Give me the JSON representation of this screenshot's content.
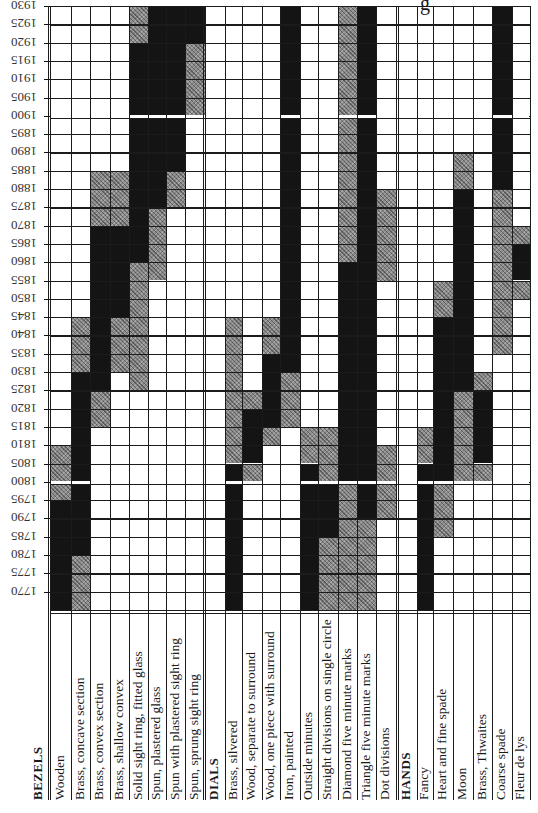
{
  "chart_data": {
    "type": "heatmap",
    "title": "",
    "title_fragment_visible": "g",
    "orientation_note": "Year axis labels printed rotated 180 degrees; category labels rotated 90 degrees (read bottom-to-top)",
    "ylabel": "Year",
    "y_ticks": [
      1930,
      1925,
      1920,
      1915,
      1910,
      1905,
      1900,
      1895,
      1890,
      1885,
      1880,
      1875,
      1870,
      1865,
      1860,
      1855,
      1850,
      1845,
      1840,
      1835,
      1830,
      1825,
      1820,
      1815,
      1810,
      1805,
      1800,
      1795,
      1790,
      1785,
      1780,
      1775,
      1770
    ],
    "row_interval_years": 5,
    "legend": {
      "B": "solid black (in common use)",
      "H": "hatched grey (occasional / transitional use)"
    },
    "groups": [
      {
        "name": "BEZELS",
        "items": [
          {
            "label": "Wooden",
            "spans": [
              {
                "t": "H",
                "from": 1810,
                "to": 1795
              },
              {
                "t": "B",
                "from": 1795,
                "to": 1765
              }
            ]
          },
          {
            "label": "Brass, concave section",
            "spans": [
              {
                "t": "H",
                "from": 1845,
                "to": 1830
              },
              {
                "t": "B",
                "from": 1830,
                "to": 1780
              },
              {
                "t": "H",
                "from": 1780,
                "to": 1765
              }
            ]
          },
          {
            "label": "Brass, convex section",
            "spans": [
              {
                "t": "H",
                "from": 1885,
                "to": 1870
              },
              {
                "t": "B",
                "from": 1870,
                "to": 1825
              },
              {
                "t": "H",
                "from": 1825,
                "to": 1815
              }
            ]
          },
          {
            "label": "Brass, shallow convex",
            "spans": [
              {
                "t": "H",
                "from": 1885,
                "to": 1870
              },
              {
                "t": "B",
                "from": 1870,
                "to": 1845
              },
              {
                "t": "H",
                "from": 1845,
                "to": 1830
              }
            ]
          },
          {
            "label": "Solid sight ring, fitted glass",
            "spans": [
              {
                "t": "H",
                "from": 1930,
                "to": 1920
              },
              {
                "t": "B",
                "from": 1920,
                "to": 1860
              },
              {
                "t": "H",
                "from": 1860,
                "to": 1825
              }
            ]
          },
          {
            "label": "Spun, plastered glass",
            "spans": [
              {
                "t": "B",
                "from": 1930,
                "to": 1875
              },
              {
                "t": "H",
                "from": 1875,
                "to": 1855
              }
            ]
          },
          {
            "label": "Spun with plastered sight ring",
            "spans": [
              {
                "t": "B",
                "from": 1930,
                "to": 1885
              },
              {
                "t": "H",
                "from": 1885,
                "to": 1875
              }
            ]
          },
          {
            "label": "Spun, sprung sight ring",
            "spans": [
              {
                "t": "B",
                "from": 1930,
                "to": 1920
              },
              {
                "t": "H",
                "from": 1920,
                "to": 1900
              }
            ]
          }
        ]
      },
      {
        "name": "DIALS",
        "items": [
          {
            "label": "Brass, silvered",
            "spans": [
              {
                "t": "H",
                "from": 1845,
                "to": 1805
              },
              {
                "t": "B",
                "from": 1805,
                "to": 1765
              }
            ]
          },
          {
            "label": "Wood, separate to surround",
            "spans": [
              {
                "t": "H",
                "from": 1825,
                "to": 1820
              },
              {
                "t": "B",
                "from": 1820,
                "to": 1805
              },
              {
                "t": "H",
                "from": 1805,
                "to": 1800
              }
            ]
          },
          {
            "label": "Wood, one piece with surround",
            "spans": [
              {
                "t": "H",
                "from": 1845,
                "to": 1835
              },
              {
                "t": "B",
                "from": 1835,
                "to": 1815
              },
              {
                "t": "H",
                "from": 1815,
                "to": 1810
              }
            ]
          },
          {
            "label": "Iron, painted",
            "spans": [
              {
                "t": "B",
                "from": 1930,
                "to": 1830
              },
              {
                "t": "H",
                "from": 1830,
                "to": 1815
              }
            ]
          },
          {
            "label": "Outside minutes",
            "spans": [
              {
                "t": "H",
                "from": 1815,
                "to": 1805
              },
              {
                "t": "B",
                "from": 1805,
                "to": 1765
              }
            ]
          },
          {
            "label": "Straight divisions on single circle",
            "spans": [
              {
                "t": "H",
                "from": 1815,
                "to": 1800
              },
              {
                "t": "B",
                "from": 1800,
                "to": 1785
              },
              {
                "t": "H",
                "from": 1785,
                "to": 1765
              }
            ]
          },
          {
            "label": "Diamond five minute marks",
            "spans": [
              {
                "t": "H",
                "from": 1930,
                "to": 1860
              },
              {
                "t": "B",
                "from": 1860,
                "to": 1800
              },
              {
                "t": "H",
                "from": 1800,
                "to": 1765
              }
            ]
          },
          {
            "label": "Triangle five minute marks",
            "spans": [
              {
                "t": "B",
                "from": 1930,
                "to": 1790
              },
              {
                "t": "H",
                "from": 1790,
                "to": 1765
              }
            ]
          },
          {
            "label": "Dot divisions",
            "spans": [
              {
                "t": "H",
                "from": 1880,
                "to": 1855
              },
              {
                "t": "H",
                "from": 1810,
                "to": 1790
              }
            ]
          }
        ]
      },
      {
        "name": "HANDS",
        "items": [
          {
            "label": "Fancy",
            "spans": [
              {
                "t": "H",
                "from": 1815,
                "to": 1805
              },
              {
                "t": "B",
                "from": 1805,
                "to": 1765
              }
            ]
          },
          {
            "label": "Heart and fine spade",
            "spans": [
              {
                "t": "H",
                "from": 1855,
                "to": 1845
              },
              {
                "t": "B",
                "from": 1845,
                "to": 1800
              },
              {
                "t": "H",
                "from": 1800,
                "to": 1785
              }
            ]
          },
          {
            "label": "Moon",
            "spans": [
              {
                "t": "H",
                "from": 1890,
                "to": 1880
              },
              {
                "t": "B",
                "from": 1880,
                "to": 1825
              },
              {
                "t": "H",
                "from": 1825,
                "to": 1800
              }
            ]
          },
          {
            "label": "Brass, Thwaites",
            "spans": [
              {
                "t": "H",
                "from": 1830,
                "to": 1825
              },
              {
                "t": "B",
                "from": 1825,
                "to": 1805
              },
              {
                "t": "H",
                "from": 1805,
                "to": 1800
              }
            ]
          },
          {
            "label": "Coarse spade",
            "spans": [
              {
                "t": "B",
                "from": 1930,
                "to": 1880
              },
              {
                "t": "H",
                "from": 1880,
                "to": 1835
              }
            ]
          },
          {
            "label": "Fleur de lys",
            "spans": [
              {
                "t": "H",
                "from": 1870,
                "to": 1865
              },
              {
                "t": "B",
                "from": 1865,
                "to": 1855
              },
              {
                "t": "H",
                "from": 1855,
                "to": 1850
              }
            ]
          }
        ]
      }
    ],
    "grid": true,
    "legend_position": "none"
  },
  "layout": {
    "grid_top": 6,
    "row_height": 18.3,
    "rows": 33,
    "columns": [
      {
        "kind": "item",
        "g": 0,
        "i": 0,
        "x": 50,
        "w": 21
      },
      {
        "kind": "item",
        "g": 0,
        "i": 1,
        "x": 71,
        "w": 19
      },
      {
        "kind": "item",
        "g": 0,
        "i": 2,
        "x": 90,
        "w": 20
      },
      {
        "kind": "item",
        "g": 0,
        "i": 3,
        "x": 110,
        "w": 19
      },
      {
        "kind": "item",
        "g": 0,
        "i": 4,
        "x": 129,
        "w": 19
      },
      {
        "kind": "item",
        "g": 0,
        "i": 5,
        "x": 148,
        "w": 18
      },
      {
        "kind": "item",
        "g": 0,
        "i": 6,
        "x": 166,
        "w": 19
      },
      {
        "kind": "item",
        "g": 0,
        "i": 7,
        "x": 185,
        "w": 20
      },
      {
        "kind": "head",
        "g": 1,
        "x": 205,
        "w": 20
      },
      {
        "kind": "item",
        "g": 1,
        "i": 0,
        "x": 225,
        "w": 17
      },
      {
        "kind": "item",
        "g": 1,
        "i": 1,
        "x": 242,
        "w": 20
      },
      {
        "kind": "item",
        "g": 1,
        "i": 2,
        "x": 262,
        "w": 18
      },
      {
        "kind": "item",
        "g": 1,
        "i": 3,
        "x": 280,
        "w": 20
      },
      {
        "kind": "item",
        "g": 1,
        "i": 4,
        "x": 300,
        "w": 18
      },
      {
        "kind": "item",
        "g": 1,
        "i": 5,
        "x": 318,
        "w": 20
      },
      {
        "kind": "item",
        "g": 1,
        "i": 6,
        "x": 338,
        "w": 19
      },
      {
        "kind": "item",
        "g": 1,
        "i": 7,
        "x": 357,
        "w": 19
      },
      {
        "kind": "item",
        "g": 1,
        "i": 8,
        "x": 376,
        "w": 20
      },
      {
        "kind": "head",
        "g": 2,
        "x": 396,
        "w": 21
      },
      {
        "kind": "item",
        "g": 2,
        "i": 0,
        "x": 417,
        "w": 16
      },
      {
        "kind": "item",
        "g": 2,
        "i": 1,
        "x": 433,
        "w": 20
      },
      {
        "kind": "item",
        "g": 2,
        "i": 2,
        "x": 453,
        "w": 20
      },
      {
        "kind": "item",
        "g": 2,
        "i": 3,
        "x": 473,
        "w": 19
      },
      {
        "kind": "item",
        "g": 2,
        "i": 4,
        "x": 492,
        "w": 20
      },
      {
        "kind": "item",
        "g": 2,
        "i": 5,
        "x": 512,
        "w": 18
      }
    ]
  }
}
